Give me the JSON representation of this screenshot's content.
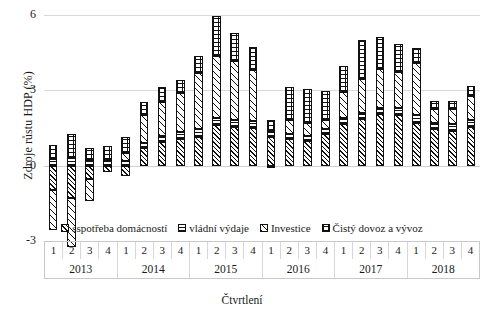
{
  "chart_data": {
    "type": "bar",
    "stacked": true,
    "title": "",
    "xlabel": "Čtvrtlení",
    "ylabel": "Zdroje růstu HDP (%)",
    "ylim": [
      -3,
      6
    ],
    "yticks": [
      6,
      3,
      0,
      -3
    ],
    "grid": true,
    "legend_position": "bottom",
    "categories": [
      "2013 Q1",
      "2013 Q2",
      "2013 Q3",
      "2013 Q4",
      "2014 Q1",
      "2014 Q2",
      "2014 Q3",
      "2014 Q4",
      "2015 Q1",
      "2015 Q2",
      "2015 Q3",
      "2015 Q4",
      "2016 Q1",
      "2016 Q2",
      "2016 Q3",
      "2016 Q4",
      "2017 Q1",
      "2017 Q2",
      "2017 Q3",
      "2017 Q4",
      "2018 Q1",
      "2018 Q2",
      "2018 Q3",
      "2018 Q4"
    ],
    "quarter_labels": [
      "1",
      "2",
      "3",
      "4",
      "1",
      "2",
      "3",
      "4",
      "1",
      "2",
      "3",
      "4",
      "1",
      "2",
      "3",
      "4",
      "1",
      "2",
      "3",
      "4",
      "1",
      "2",
      "3",
      "4"
    ],
    "year_labels": [
      "2013",
      "2014",
      "2015",
      "2016",
      "2017",
      "2018"
    ],
    "quarters_per_year": 4,
    "series": [
      {
        "name": "sspotřeba domácností",
        "pattern": "dense-diagonal-hatch",
        "values": [
          -0.95,
          -1.3,
          -0.55,
          -0.25,
          -0.4,
          0.7,
          0.95,
          1.05,
          1.15,
          1.6,
          1.55,
          1.5,
          1.15,
          1.05,
          1.0,
          1.25,
          1.65,
          1.85,
          2.05,
          2.0,
          1.7,
          1.45,
          1.4,
          1.55
        ]
      },
      {
        "name": "vládní výdaje",
        "pattern": "horizontal-lines",
        "values": [
          0.28,
          0.3,
          0.22,
          0.18,
          0.2,
          0.22,
          0.25,
          0.28,
          0.3,
          0.3,
          0.28,
          0.26,
          0.22,
          0.2,
          0.2,
          0.22,
          0.25,
          0.24,
          0.26,
          0.28,
          0.3,
          0.26,
          0.24,
          0.26
        ]
      },
      {
        "name": "Investice",
        "pattern": "sparse-diagonal-hatch",
        "values": [
          -1.6,
          -1.95,
          -0.85,
          0.05,
          0.3,
          1.1,
          1.35,
          1.55,
          2.25,
          2.45,
          2.35,
          2.05,
          -0.05,
          0.55,
          0.5,
          0.35,
          1.05,
          1.35,
          1.55,
          1.45,
          2.1,
          0.55,
          0.6,
          0.95
        ]
      },
      {
        "name": "Čistý dovoz a vývoz",
        "pattern": "fine-checker",
        "values": [
          0.55,
          0.95,
          0.5,
          0.55,
          0.65,
          0.5,
          0.6,
          0.55,
          0.65,
          1.6,
          1.1,
          0.9,
          0.45,
          1.35,
          1.35,
          1.15,
          1.0,
          1.55,
          1.25,
          1.1,
          0.6,
          0.3,
          0.35,
          0.4
        ]
      }
    ],
    "colors": {
      "stroke": "#111111",
      "background": "#ffffff",
      "gridline": "#d9d9d9"
    }
  }
}
